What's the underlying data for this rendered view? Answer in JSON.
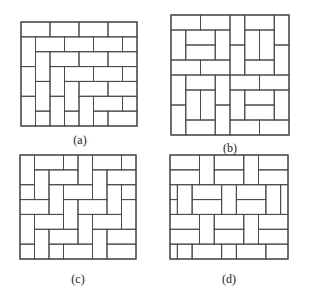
{
  "figure": {
    "stroke": "#4a4a4a",
    "panels": [
      {
        "id": "a",
        "label": "(a)",
        "box": {
          "x": 21,
          "y": 22,
          "w": 116,
          "h": 104
        },
        "grid": {
          "cols": 8,
          "rows": 7
        },
        "label_pos": {
          "x": 60,
          "y": 133
        },
        "rects": [
          [
            0,
            0,
            2,
            1
          ],
          [
            2,
            0,
            2,
            1
          ],
          [
            4,
            0,
            2,
            1
          ],
          [
            6,
            0,
            2,
            1
          ],
          [
            0,
            1,
            1,
            2
          ],
          [
            1,
            1,
            2,
            1
          ],
          [
            3,
            1,
            2,
            1
          ],
          [
            5,
            1,
            2,
            1
          ],
          [
            7,
            1,
            1,
            1
          ],
          [
            1,
            2,
            1,
            2
          ],
          [
            2,
            2,
            2,
            1
          ],
          [
            4,
            2,
            2,
            1
          ],
          [
            6,
            2,
            2,
            1
          ],
          [
            0,
            3,
            1,
            2
          ],
          [
            2,
            3,
            1,
            2
          ],
          [
            3,
            3,
            2,
            1
          ],
          [
            5,
            3,
            2,
            1
          ],
          [
            7,
            3,
            1,
            1
          ],
          [
            1,
            4,
            1,
            2
          ],
          [
            3,
            4,
            1,
            2
          ],
          [
            4,
            4,
            2,
            1
          ],
          [
            6,
            4,
            2,
            1
          ],
          [
            0,
            5,
            1,
            2
          ],
          [
            2,
            5,
            1,
            2
          ],
          [
            4,
            5,
            1,
            2
          ],
          [
            5,
            5,
            2,
            1
          ],
          [
            7,
            5,
            1,
            1
          ],
          [
            1,
            6,
            1,
            1
          ],
          [
            3,
            6,
            1,
            1
          ],
          [
            5,
            6,
            1,
            1
          ],
          [
            6,
            6,
            2,
            1
          ]
        ]
      },
      {
        "id": "b",
        "label": "(b)",
        "box": {
          "x": 171,
          "y": 15,
          "w": 118,
          "h": 120
        },
        "grid": {
          "cols": 8,
          "rows": 8
        },
        "label_pos": {
          "x": 210,
          "y": 141
        },
        "rects": [
          [
            0,
            0,
            2,
            1
          ],
          [
            2,
            0,
            2,
            1
          ],
          [
            4,
            0,
            1,
            2
          ],
          [
            5,
            0,
            2,
            1
          ],
          [
            7,
            0,
            1,
            2
          ],
          [
            0,
            1,
            1,
            2
          ],
          [
            1,
            1,
            2,
            1
          ],
          [
            3,
            1,
            1,
            2
          ],
          [
            5,
            1,
            1,
            2
          ],
          [
            6,
            1,
            1,
            2
          ],
          [
            1,
            2,
            2,
            1
          ],
          [
            4,
            2,
            1,
            2
          ],
          [
            7,
            2,
            1,
            2
          ],
          [
            0,
            3,
            2,
            1
          ],
          [
            2,
            3,
            2,
            1
          ],
          [
            5,
            3,
            2,
            1
          ],
          [
            0,
            4,
            1,
            2
          ],
          [
            1,
            4,
            2,
            1
          ],
          [
            3,
            4,
            1,
            2
          ],
          [
            4,
            4,
            2,
            1
          ],
          [
            6,
            4,
            2,
            1
          ],
          [
            1,
            5,
            1,
            2
          ],
          [
            2,
            5,
            1,
            2
          ],
          [
            4,
            5,
            1,
            2
          ],
          [
            5,
            5,
            2,
            1
          ],
          [
            7,
            5,
            1,
            2
          ],
          [
            0,
            6,
            1,
            2
          ],
          [
            3,
            6,
            1,
            2
          ],
          [
            5,
            6,
            2,
            1
          ],
          [
            1,
            7,
            2,
            1
          ],
          [
            4,
            7,
            2,
            1
          ],
          [
            6,
            7,
            2,
            1
          ]
        ]
      },
      {
        "id": "c",
        "label": "(c)",
        "box": {
          "x": 20,
          "y": 155,
          "w": 116,
          "h": 104
        },
        "grid": {
          "cols": 8,
          "rows": 7
        },
        "label_pos": {
          "x": 58,
          "y": 272
        },
        "rects": [
          [
            0,
            0,
            1,
            2
          ],
          [
            1,
            0,
            2,
            1
          ],
          [
            3,
            0,
            1,
            1
          ],
          [
            4,
            0,
            1,
            2
          ],
          [
            5,
            0,
            2,
            1
          ],
          [
            7,
            0,
            1,
            1
          ],
          [
            1,
            1,
            1,
            2
          ],
          [
            2,
            1,
            2,
            1
          ],
          [
            5,
            1,
            1,
            2
          ],
          [
            6,
            1,
            2,
            1
          ],
          [
            0,
            2,
            1,
            1
          ],
          [
            2,
            2,
            1,
            2
          ],
          [
            3,
            2,
            2,
            1
          ],
          [
            6,
            2,
            1,
            2
          ],
          [
            7,
            2,
            1,
            1
          ],
          [
            0,
            3,
            2,
            1
          ],
          [
            3,
            3,
            1,
            2
          ],
          [
            4,
            3,
            2,
            1
          ],
          [
            7,
            3,
            1,
            2
          ],
          [
            0,
            4,
            1,
            2
          ],
          [
            1,
            4,
            2,
            1
          ],
          [
            4,
            4,
            1,
            2
          ],
          [
            5,
            4,
            2,
            1
          ],
          [
            1,
            5,
            1,
            2
          ],
          [
            2,
            5,
            2,
            1
          ],
          [
            5,
            5,
            1,
            2
          ],
          [
            6,
            5,
            2,
            1
          ],
          [
            0,
            6,
            1,
            1
          ],
          [
            2,
            6,
            1,
            1
          ],
          [
            3,
            6,
            2,
            1
          ],
          [
            6,
            6,
            2,
            1
          ]
        ]
      },
      {
        "id": "d",
        "label": "(d)",
        "box": {
          "x": 170,
          "y": 155,
          "w": 118,
          "h": 104
        },
        "grid": {
          "cols": 16,
          "rows": 7
        },
        "label_pos": {
          "x": 209,
          "y": 272
        },
        "rects": [
          [
            0,
            0,
            4,
            1
          ],
          [
            0,
            1,
            4,
            1
          ],
          [
            4,
            0,
            2,
            2
          ],
          [
            6,
            0,
            4,
            1
          ],
          [
            6,
            1,
            4,
            1
          ],
          [
            10,
            0,
            2,
            2
          ],
          [
            12,
            0,
            4,
            1
          ],
          [
            12,
            1,
            4,
            1
          ],
          [
            0,
            2,
            1,
            1
          ],
          [
            0,
            3,
            1,
            1
          ],
          [
            1,
            2,
            2,
            2
          ],
          [
            3,
            2,
            4,
            1
          ],
          [
            3,
            3,
            4,
            1
          ],
          [
            7,
            2,
            2,
            2
          ],
          [
            9,
            2,
            4,
            1
          ],
          [
            9,
            3,
            4,
            1
          ],
          [
            13,
            2,
            2,
            2
          ],
          [
            15,
            2,
            1,
            2
          ],
          [
            0,
            4,
            4,
            1
          ],
          [
            0,
            5,
            4,
            1
          ],
          [
            4,
            4,
            2,
            2
          ],
          [
            6,
            4,
            4,
            1
          ],
          [
            6,
            5,
            4,
            1
          ],
          [
            10,
            4,
            2,
            2
          ],
          [
            12,
            4,
            4,
            1
          ],
          [
            12,
            5,
            4,
            1
          ],
          [
            0,
            6,
            1,
            1
          ],
          [
            1,
            6,
            2,
            1
          ],
          [
            3,
            6,
            4,
            1
          ],
          [
            7,
            6,
            2,
            1
          ],
          [
            9,
            6,
            4,
            1
          ],
          [
            13,
            6,
            3,
            1
          ]
        ]
      }
    ]
  }
}
